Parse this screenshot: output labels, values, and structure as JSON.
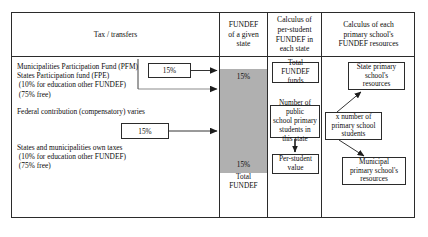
{
  "diagram": {
    "columns": [
      {
        "id": "tax-transfers",
        "header": "Tax / transfers"
      },
      {
        "id": "fundef-state",
        "header": "FUNDEF\nof a given\nstate"
      },
      {
        "id": "per-student",
        "header": "Calculus of\nper-student\nFUNDEF in\neach state"
      },
      {
        "id": "school-resources",
        "header": "Calculus of each\nprimary school's\nFUNDEF resources"
      }
    ],
    "sources": {
      "participation_funds": "Municipalities Participation Fund (PFM)\nStates Participation fund (FPE)\n (10% for education other FUNDEF)\n (75% free)",
      "federal_contribution": "Federal contribution (compensatory) varies",
      "own_taxes": "States and municipalities own taxes\n (10% for education other FUNDEF)\n (75% free)"
    },
    "percent_boxes": {
      "participation_share": "15%",
      "own_taxes_share": "15%"
    },
    "fundef_column": {
      "share_top": "15%",
      "share_bottom": "15%",
      "total_label": "Total\nFUNDEF"
    },
    "per_student_nodes": {
      "total_funds": "Total FUNDEF\nfunds",
      "student_count": "Number of public\nschool primary\nstudents in\nthis state",
      "per_student_value": "Per-student\nvalue"
    },
    "school_nodes": {
      "state_school": "State primary\nschool's\nresources",
      "multiplier": "x number of\nprimary school\nstudents",
      "municipal_school": "Municipal\nprimary school's\nresources"
    },
    "colors": {
      "line": "#2b2b2b",
      "fundef_fill": "#b0b0b0",
      "background": "#ffffff"
    }
  }
}
